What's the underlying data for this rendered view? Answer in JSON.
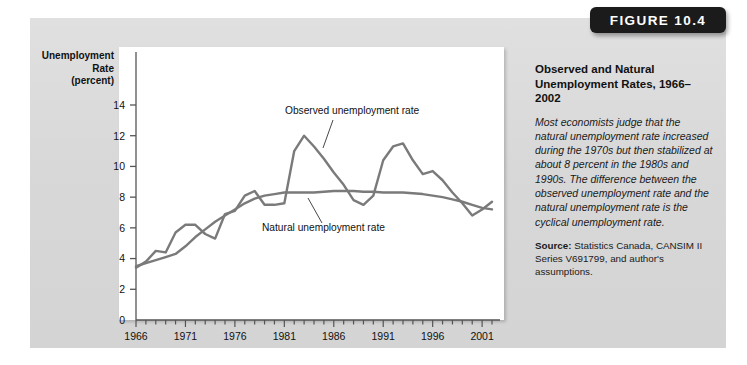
{
  "figure_badge": "FIGURE 10.4",
  "caption": {
    "title": "Observed and Natural Unemployment Rates, 1966–2002",
    "body": "Most economists judge that the natural unemployment rate increased during the 1970s but then stabilized at about 8 percent in the 1980s and 1990s. The difference between the observed unemployment rate and the natural unemployment rate is the cyclical unemployment rate.",
    "source_label": "Source:",
    "source_text": " Statistics Canada, CANSIM II Series V691799, and author's assumptions."
  },
  "colors": {
    "panel": "#dcdcdc",
    "plot_background": "#ffffff",
    "line": "#7a7a7a",
    "axis": "#555555",
    "badge": "#1b1b1b",
    "text": "#111111"
  },
  "chart_data": {
    "type": "line",
    "title": "Observed and Natural Unemployment Rates, 1966–2002",
    "xlabel": "",
    "ylabel": "Unemployment Rate (percent)",
    "ylabel_lines": [
      "Unemployment",
      "Rate",
      "(percent)"
    ],
    "xlim": [
      1966,
      2002
    ],
    "ylim": [
      0,
      15
    ],
    "yticks": [
      0,
      2,
      4,
      6,
      8,
      10,
      12,
      14
    ],
    "ytick_labels": [
      "0",
      "2",
      "4",
      "6",
      "8",
      "10",
      "12",
      "14"
    ],
    "xticks": [
      1966,
      1971,
      1976,
      1981,
      1986,
      1991,
      1996,
      2001
    ],
    "xtick_labels": [
      "1966",
      "1971",
      "1976",
      "1981",
      "1986",
      "1991",
      "1996",
      "2001"
    ],
    "x_minor_tick_step": 1,
    "grid": false,
    "legend": "inline-annotations",
    "annotations": [
      {
        "text": "Observed unemployment rate",
        "series": "Observed unemployment rate"
      },
      {
        "text": "Natural unemployment rate",
        "series": "Natural unemployment rate"
      }
    ],
    "x": [
      1966,
      1967,
      1968,
      1969,
      1970,
      1971,
      1972,
      1973,
      1974,
      1975,
      1976,
      1977,
      1978,
      1979,
      1980,
      1981,
      1982,
      1983,
      1984,
      1985,
      1986,
      1987,
      1988,
      1989,
      1990,
      1991,
      1992,
      1993,
      1994,
      1995,
      1996,
      1997,
      1998,
      1999,
      2000,
      2001,
      2002
    ],
    "series": [
      {
        "name": "Observed unemployment rate",
        "values": [
          3.4,
          3.8,
          4.5,
          4.4,
          5.7,
          6.2,
          6.2,
          5.6,
          5.3,
          6.9,
          7.1,
          8.1,
          8.4,
          7.5,
          7.5,
          7.6,
          11.0,
          12.0,
          11.3,
          10.5,
          9.6,
          8.8,
          7.8,
          7.5,
          8.1,
          10.4,
          11.3,
          11.5,
          10.4,
          9.5,
          9.7,
          9.1,
          8.3,
          7.6,
          6.8,
          7.2,
          7.7
        ]
      },
      {
        "name": "Natural unemployment rate",
        "values": [
          3.5,
          3.7,
          3.9,
          4.1,
          4.3,
          4.8,
          5.4,
          5.9,
          6.4,
          6.8,
          7.2,
          7.6,
          7.9,
          8.1,
          8.2,
          8.3,
          8.3,
          8.3,
          8.3,
          8.35,
          8.4,
          8.4,
          8.4,
          8.35,
          8.35,
          8.3,
          8.3,
          8.3,
          8.25,
          8.2,
          8.1,
          8.0,
          7.85,
          7.7,
          7.5,
          7.3,
          7.2
        ]
      }
    ]
  }
}
